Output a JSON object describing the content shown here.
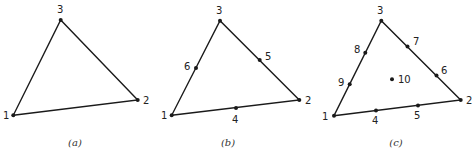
{
  "figure": {
    "panels": [
      {
        "caption": "(a)",
        "vertices": [
          [
            13.3,
            115.3
          ],
          [
            137.7,
            100
          ],
          [
            60.7,
            20
          ]
        ],
        "nodes": [
          {
            "label": "1",
            "x": 13.3,
            "y": 115.3,
            "lx": 3,
            "ly": 119
          },
          {
            "label": "2",
            "x": 137.7,
            "y": 100,
            "lx": 143,
            "ly": 104
          },
          {
            "label": "3",
            "x": 60.7,
            "y": 20,
            "lx": 57,
            "ly": 13
          }
        ],
        "caption_pos": [
          75,
          146
        ]
      },
      {
        "caption": "(b)",
        "vertices": [
          [
            171.7,
            115.3
          ],
          [
            299.3,
            100
          ],
          [
            220,
            20.7
          ]
        ],
        "nodes": [
          {
            "label": "1",
            "x": 171.7,
            "y": 115.3,
            "lx": 161,
            "ly": 119
          },
          {
            "label": "2",
            "x": 299.3,
            "y": 100,
            "lx": 305,
            "ly": 104
          },
          {
            "label": "3",
            "x": 220,
            "y": 20.7,
            "lx": 216,
            "ly": 14
          },
          {
            "label": "4",
            "x": 236,
            "y": 108,
            "lx": 232,
            "ly": 123
          },
          {
            "label": "5",
            "x": 259.7,
            "y": 60,
            "lx": 265,
            "ly": 60
          },
          {
            "label": "6",
            "x": 196,
            "y": 68,
            "lx": 184,
            "ly": 70
          }
        ],
        "caption_pos": [
          228,
          146
        ]
      },
      {
        "caption": "(c)",
        "vertices": [
          [
            334,
            115.7
          ],
          [
            460.7,
            100
          ],
          [
            381.3,
            20.7
          ]
        ],
        "nodes": [
          {
            "label": "1",
            "x": 334,
            "y": 115.7,
            "lx": 322,
            "ly": 120
          },
          {
            "label": "2",
            "x": 460.7,
            "y": 100,
            "lx": 466,
            "ly": 104
          },
          {
            "label": "3",
            "x": 381.3,
            "y": 20.7,
            "lx": 377,
            "ly": 14
          },
          {
            "label": "4",
            "x": 376,
            "y": 110.5,
            "lx": 372,
            "ly": 124
          },
          {
            "label": "5",
            "x": 418,
            "y": 105.5,
            "lx": 414,
            "ly": 119
          },
          {
            "label": "6",
            "x": 436.5,
            "y": 75.5,
            "lx": 441,
            "ly": 74
          },
          {
            "label": "7",
            "x": 407.5,
            "y": 46.5,
            "lx": 413,
            "ly": 45
          },
          {
            "label": "8",
            "x": 365.3,
            "y": 52.7,
            "lx": 354,
            "ly": 53
          },
          {
            "label": "9",
            "x": 349.7,
            "y": 84.3,
            "lx": 338,
            "ly": 86
          },
          {
            "label": "10",
            "x": 392,
            "y": 79.3,
            "lx": 398,
            "ly": 83
          }
        ],
        "caption_pos": [
          396,
          146
        ]
      }
    ]
  }
}
